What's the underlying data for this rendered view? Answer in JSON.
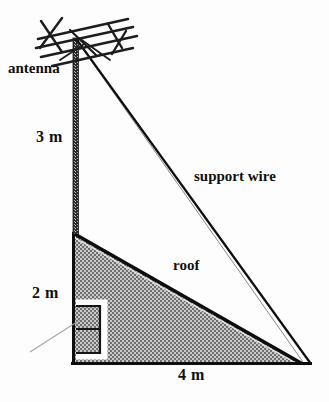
{
  "figure": {
    "width": 329,
    "height": 402,
    "background_color": "#fdfdfd"
  },
  "labels": {
    "antenna": "antenna",
    "mast_height": "3 m",
    "wall_height": "2 m",
    "base_width": "4 m",
    "roof": "roof",
    "support_wire": "support wire"
  },
  "colors": {
    "ink": "#101010",
    "roof_fill": "#8c8c8c",
    "leader_line": "#9a9a9a",
    "window_outline": "#101010",
    "window_border": "#ffffff"
  },
  "geometry": {
    "mast_top": [
      76,
      38
    ],
    "mast_bottom": [
      76,
      233
    ],
    "roof_peak": [
      73,
      232
    ],
    "roof_right": [
      300,
      363
    ],
    "base_left": [
      73,
      363
    ],
    "wire_anchor": [
      311,
      363
    ],
    "mast_height_label_value": "3 m",
    "wall_height_label_value": "2 m",
    "base_width_label_value": "4 m"
  },
  "parts": {
    "antenna_icon": "tv-yagi-antenna",
    "mast_icon": "vertical-hatched-mast",
    "roof_icon": "shaded-right-triangle",
    "window_icon": "window-rectangle",
    "wire_icon": "support-wire-line",
    "leader_icon": "leader-line"
  }
}
